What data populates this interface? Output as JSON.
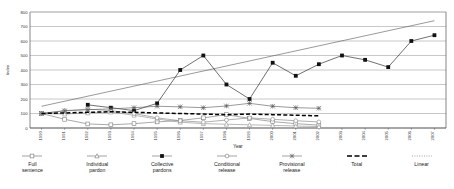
{
  "chart_data": {
    "type": "line",
    "title": "",
    "xlabel": "Year",
    "ylabel": "Index",
    "ylim": [
      0,
      800
    ],
    "ytick_step": 100,
    "yticks": [
      0,
      100,
      200,
      300,
      400,
      500,
      600,
      700,
      800
    ],
    "grid": true,
    "legend_position": "bottom",
    "categories": [
      "1990",
      "1991",
      "1992",
      "1993",
      "1994",
      "1995",
      "1996",
      "1997",
      "1998",
      "1999",
      "2000",
      "2001",
      "2002",
      "2003",
      "2004",
      "2005",
      "2006",
      "2007"
    ],
    "x": [
      1990,
      1991,
      1992,
      1993,
      1994,
      1995,
      1996,
      1997,
      1998,
      1999,
      2000,
      2001,
      2002,
      2003,
      2004,
      2005,
      2006,
      2007
    ],
    "series": [
      {
        "name": "Full sentence",
        "marker": "open-square",
        "color": "#6e6e6e",
        "values": [
          100,
          60,
          28,
          22,
          30,
          42,
          52,
          70,
          92,
          66,
          44,
          30,
          20,
          null,
          null,
          null,
          null,
          null
        ]
      },
      {
        "name": "Individual pardon",
        "marker": "open-triangle",
        "color": "#8a8a8a",
        "values": [
          100,
          96,
          104,
          110,
          88,
          62,
          40,
          30,
          26,
          22,
          18,
          14,
          10,
          null,
          null,
          null,
          null,
          null
        ]
      },
      {
        "name": "Collective pardons",
        "marker": "filled-square",
        "color": "#111111",
        "values": [
          null,
          null,
          160,
          140,
          120,
          170,
          400,
          500,
          300,
          200,
          450,
          360,
          440,
          500,
          470,
          420,
          600,
          640
        ]
      },
      {
        "name": "Conditional release",
        "marker": "open-circle",
        "color": "#7a7a7a",
        "values": [
          100,
          120,
          130,
          120,
          100,
          70,
          50,
          40,
          55,
          70,
          60,
          50,
          42,
          null,
          null,
          null,
          null,
          null
        ]
      },
      {
        "name": "Provisional release",
        "marker": "star-x",
        "color": "#555555",
        "values": [
          100,
          118,
          126,
          132,
          140,
          150,
          146,
          140,
          152,
          170,
          150,
          140,
          136,
          null,
          null,
          null,
          null,
          null
        ]
      },
      {
        "name": "Total",
        "marker": "dashed",
        "color": "#000000",
        "values": [
          100,
          104,
          108,
          112,
          108,
          104,
          100,
          96,
          92,
          96,
          92,
          88,
          84,
          null,
          null,
          null,
          null,
          null
        ]
      }
    ],
    "trendline": {
      "name": "Linear",
      "style": "thin-solid",
      "color": "#555555",
      "from": {
        "x": 1990,
        "y": 150
      },
      "to": {
        "x": 2007,
        "y": 740
      }
    }
  },
  "legend": {
    "items": [
      {
        "label": "Full\nsentence",
        "key": "open-square"
      },
      {
        "label": "Individual\npardon",
        "key": "open-triangle"
      },
      {
        "label": "Collective\npardons",
        "key": "filled-square"
      },
      {
        "label": "Conditional\nrelease",
        "key": "open-circle"
      },
      {
        "label": "Provisional\nrelease",
        "key": "star-x"
      },
      {
        "label": "Total",
        "key": "dashed"
      },
      {
        "label": "Linear",
        "key": "dotted"
      }
    ]
  }
}
